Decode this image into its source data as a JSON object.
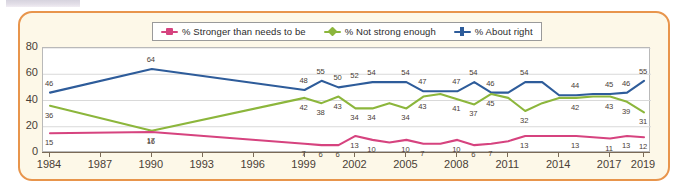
{
  "chart_data": {
    "type": "line",
    "title": "",
    "xlabel": "",
    "ylabel": "",
    "ylim": [
      0,
      80
    ],
    "yticks": [
      0,
      20,
      40,
      60,
      80
    ],
    "xticks": [
      "1984",
      "1987",
      "1990",
      "1993",
      "1996",
      "1999",
      "2002",
      "2005",
      "2008",
      "2011",
      "2014",
      "2017",
      "2019"
    ],
    "grid": "horizontal",
    "legend_position": "top-center",
    "x": [
      1984,
      1990,
      1999,
      2000,
      2001,
      2002,
      2003,
      2004,
      2005,
      2006,
      2007,
      2008,
      2009,
      2010,
      2011,
      2012,
      2013,
      2014,
      2015,
      2016,
      2017,
      2018,
      2019
    ],
    "series": [
      {
        "name": "% About right",
        "color": "#2e5c9a",
        "values": [
          46,
          64,
          48,
          55,
          50,
          52,
          54,
          54,
          54,
          47,
          47,
          47,
          54,
          46,
          46,
          54,
          54,
          44,
          44,
          45,
          45,
          46,
          55
        ],
        "labeled_points": [
          {
            "x": 1984,
            "y": 46,
            "label": "46"
          },
          {
            "x": 1990,
            "y": 64,
            "label": "64"
          },
          {
            "x": 1999,
            "y": 48,
            "label": "48"
          },
          {
            "x": 2000,
            "y": 55,
            "label": "55"
          },
          {
            "x": 2001,
            "y": 50,
            "label": "50"
          },
          {
            "x": 2002,
            "y": 52,
            "label": "52"
          },
          {
            "x": 2003,
            "y": 54,
            "label": "54"
          },
          {
            "x": 2005,
            "y": 54,
            "label": "54"
          },
          {
            "x": 2006,
            "y": 47,
            "label": "47"
          },
          {
            "x": 2008,
            "y": 47,
            "label": "47"
          },
          {
            "x": 2009,
            "y": 54,
            "label": "54"
          },
          {
            "x": 2010,
            "y": 46,
            "label": "46"
          },
          {
            "x": 2012,
            "y": 54,
            "label": "54"
          },
          {
            "x": 2015,
            "y": 44,
            "label": "44"
          },
          {
            "x": 2017,
            "y": 45,
            "label": "45"
          },
          {
            "x": 2018,
            "y": 46,
            "label": "46"
          },
          {
            "x": 2019,
            "y": 55,
            "label": "55"
          }
        ]
      },
      {
        "name": "% Not strong enough",
        "color": "#8cb63c",
        "values": [
          36,
          17,
          42,
          38,
          43,
          34,
          34,
          38,
          34,
          43,
          45,
          41,
          37,
          45,
          42,
          32,
          38,
          42,
          42,
          43,
          43,
          39,
          31
        ],
        "labeled_points": [
          {
            "x": 1984,
            "y": 36,
            "label": "36"
          },
          {
            "x": 1990,
            "y": 17,
            "label": "17"
          },
          {
            "x": 1999,
            "y": 42,
            "label": "42"
          },
          {
            "x": 2000,
            "y": 38,
            "label": "38"
          },
          {
            "x": 2001,
            "y": 43,
            "label": "43"
          },
          {
            "x": 2002,
            "y": 34,
            "label": "34"
          },
          {
            "x": 2003,
            "y": 34,
            "label": "34"
          },
          {
            "x": 2005,
            "y": 34,
            "label": "34"
          },
          {
            "x": 2006,
            "y": 43,
            "label": "43"
          },
          {
            "x": 2008,
            "y": 41,
            "label": "41"
          },
          {
            "x": 2009,
            "y": 37,
            "label": "37"
          },
          {
            "x": 2010,
            "y": 45,
            "label": "45"
          },
          {
            "x": 2012,
            "y": 32,
            "label": "32"
          },
          {
            "x": 2015,
            "y": 42,
            "label": "42"
          },
          {
            "x": 2017,
            "y": 43,
            "label": "43"
          },
          {
            "x": 2018,
            "y": 39,
            "label": "39"
          },
          {
            "x": 2019,
            "y": 31,
            "label": "31"
          }
        ]
      },
      {
        "name": "% Stronger than needs to be",
        "color": "#d6437f",
        "values": [
          15,
          16,
          7,
          6,
          6,
          13,
          10,
          8,
          10,
          7,
          7,
          10,
          6,
          7,
          9,
          13,
          13,
          13,
          13,
          12,
          11,
          13,
          12
        ],
        "labeled_points": [
          {
            "x": 1984,
            "y": 15,
            "label": "15"
          },
          {
            "x": 1990,
            "y": 16,
            "label": "16"
          },
          {
            "x": 1999,
            "y": 7,
            "label": "7"
          },
          {
            "x": 2000,
            "y": 6,
            "label": "6"
          },
          {
            "x": 2001,
            "y": 6,
            "label": "6"
          },
          {
            "x": 2002,
            "y": 13,
            "label": "13"
          },
          {
            "x": 2003,
            "y": 10,
            "label": "10"
          },
          {
            "x": 2005,
            "y": 10,
            "label": "10"
          },
          {
            "x": 2006,
            "y": 7,
            "label": "7"
          },
          {
            "x": 2008,
            "y": 10,
            "label": "10"
          },
          {
            "x": 2009,
            "y": 6,
            "label": "6"
          },
          {
            "x": 2010,
            "y": 7,
            "label": "7"
          },
          {
            "x": 2012,
            "y": 13,
            "label": "13"
          },
          {
            "x": 2015,
            "y": 13,
            "label": "13"
          },
          {
            "x": 2017,
            "y": 11,
            "label": "11"
          },
          {
            "x": 2018,
            "y": 13,
            "label": "13"
          },
          {
            "x": 2019,
            "y": 12,
            "label": "12"
          }
        ]
      }
    ]
  },
  "legend": {
    "items": [
      {
        "label": "% Stronger than needs to be",
        "color": "#d6437f",
        "marker": "square-marker"
      },
      {
        "label": "% Not strong enough",
        "color": "#8cb63c",
        "marker": "diamond-marker"
      },
      {
        "label": "% About right",
        "color": "#2e5c9a",
        "marker": "cross-marker"
      }
    ]
  },
  "colors": {
    "frame": "#e8954c",
    "panel_background": "#fdf8e8",
    "plot_background": "#ffffff",
    "gridline": "#d9d9d9",
    "axis": "#7a6a57",
    "text": "#4a4036"
  }
}
